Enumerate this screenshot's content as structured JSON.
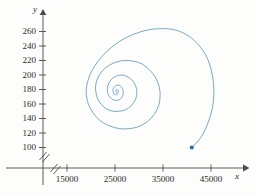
{
  "figure": {
    "axis_color": "#4a4a4a",
    "curve_color": "#6a9fc4",
    "marker_color": "#2f6fb0",
    "background": "#fdfdfb"
  },
  "axes": {
    "x_name": "x",
    "y_name": "y",
    "x_break": "//",
    "y_break": "//",
    "x_ticks": [
      "15000",
      "25000",
      "35000",
      "45000"
    ],
    "y_ticks": [
      "260",
      "240",
      "220",
      "200",
      "180",
      "160",
      "140",
      "120",
      "100"
    ]
  },
  "chart_data": {
    "type": "line",
    "title": "",
    "xlabel": "x",
    "ylabel": "y",
    "grid": false,
    "legend": "none",
    "axis_break": {
      "x": true,
      "y": true
    },
    "xlim": [
      11000,
      48000
    ],
    "ylim": [
      90,
      272
    ],
    "xticks": [
      15000,
      25000,
      35000,
      45000
    ],
    "yticks": [
      100,
      120,
      140,
      160,
      180,
      200,
      220,
      240,
      260
    ],
    "annotations": [
      {
        "label": "start point",
        "x": 41000,
        "y": 100,
        "marker": "filled-circle"
      },
      {
        "label": "equilibrium (spiral focus)",
        "x": 25400,
        "y": 176
      }
    ],
    "series": [
      {
        "name": "phase trajectory (inward spiral)",
        "points": [
          [
            41000,
            100
          ],
          [
            42800,
            113
          ],
          [
            44200,
            131
          ],
          [
            45200,
            152
          ],
          [
            45600,
            175
          ],
          [
            45300,
            199
          ],
          [
            44300,
            222
          ],
          [
            42600,
            240
          ],
          [
            40300,
            254
          ],
          [
            37600,
            262
          ],
          [
            34700,
            264
          ],
          [
            31700,
            262
          ],
          [
            28800,
            256
          ],
          [
            26100,
            247
          ],
          [
            23700,
            235
          ],
          [
            21700,
            221
          ],
          [
            20200,
            206
          ],
          [
            19300,
            191
          ],
          [
            19000,
            176
          ],
          [
            19400,
            161
          ],
          [
            20400,
            148
          ],
          [
            21900,
            137
          ],
          [
            23800,
            130
          ],
          [
            25900,
            126
          ],
          [
            28000,
            126
          ],
          [
            30000,
            129
          ],
          [
            31800,
            136
          ],
          [
            33200,
            146
          ],
          [
            34100,
            158
          ],
          [
            34400,
            171
          ],
          [
            34200,
            184
          ],
          [
            33400,
            197
          ],
          [
            32200,
            207
          ],
          [
            30700,
            215
          ],
          [
            28900,
            219
          ],
          [
            27100,
            220
          ],
          [
            25300,
            218
          ],
          [
            23700,
            213
          ],
          [
            22400,
            206
          ],
          [
            21500,
            197
          ],
          [
            21000,
            187
          ],
          [
            21000,
            177
          ],
          [
            21400,
            167
          ],
          [
            22200,
            159
          ],
          [
            23300,
            153
          ],
          [
            24600,
            150
          ],
          [
            25900,
            150
          ],
          [
            27200,
            152
          ],
          [
            28300,
            157
          ],
          [
            29100,
            164
          ],
          [
            29500,
            172
          ],
          [
            29500,
            180
          ],
          [
            29100,
            188
          ],
          [
            28400,
            194
          ],
          [
            27500,
            198
          ],
          [
            26500,
            200
          ],
          [
            25500,
            199
          ],
          [
            24600,
            196
          ],
          [
            23900,
            191
          ],
          [
            23500,
            185
          ],
          [
            23400,
            179
          ],
          [
            23600,
            173
          ],
          [
            24000,
            169
          ],
          [
            24600,
            166
          ],
          [
            25300,
            165
          ],
          [
            25900,
            166
          ],
          [
            26400,
            169
          ],
          [
            26700,
            173
          ],
          [
            26700,
            178
          ],
          [
            26500,
            182
          ],
          [
            26100,
            185
          ],
          [
            25600,
            186
          ],
          [
            25100,
            185
          ],
          [
            24800,
            183
          ],
          [
            24600,
            180
          ],
          [
            24600,
            177
          ],
          [
            24800,
            174
          ],
          [
            25100,
            173
          ],
          [
            25400,
            173
          ],
          [
            25600,
            175
          ],
          [
            25700,
            177
          ],
          [
            25600,
            179
          ],
          [
            25400,
            180
          ],
          [
            25200,
            179
          ],
          [
            25200,
            177
          ],
          [
            25300,
            176
          ],
          [
            25400,
            176
          ]
        ]
      }
    ]
  }
}
